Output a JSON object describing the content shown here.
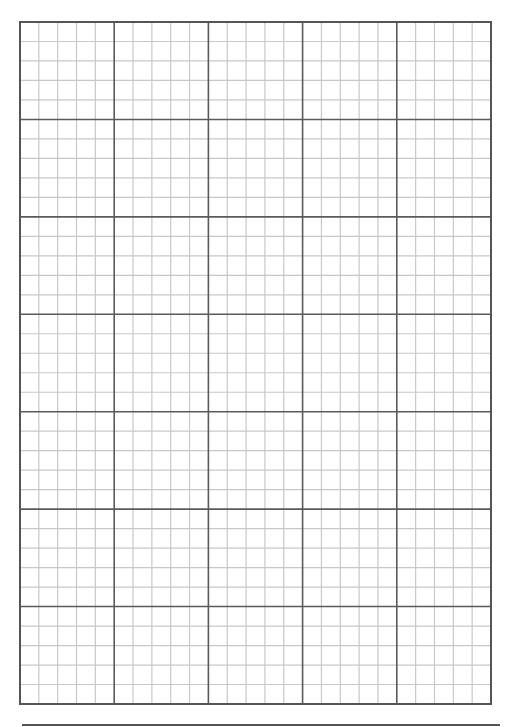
{
  "graph_paper": {
    "left": 20,
    "top": 22,
    "right": 491,
    "bottom": 704,
    "major_columns": 5,
    "major_rows": 7,
    "minor_per_major": 5,
    "colors": {
      "minor_line": "#c8c8c8",
      "major_line": "#5a5a5a",
      "border": "#555555",
      "background": "#ffffff"
    }
  },
  "bottom_rule": {
    "x1": 22,
    "x2": 500,
    "y": 725
  }
}
